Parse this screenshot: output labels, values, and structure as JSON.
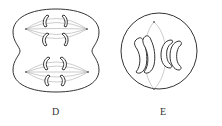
{
  "figure": {
    "panels": [
      {
        "id": "D",
        "label": "D",
        "description": "Cell undergoing second meiotic division with two spindles and cleavage furrow",
        "structures": [
          "cell-membrane-with-cleavage-furrow",
          "upper-spindle",
          "lower-spindle",
          "chromosomes",
          "centrioles"
        ]
      },
      {
        "id": "E",
        "label": "E",
        "description": "Round cell with single spindle and paired chromosomes",
        "structures": [
          "cell-membrane",
          "spindle",
          "chromosomes",
          "centrioles"
        ]
      }
    ],
    "colors": {
      "outline": "#333333",
      "spindle": "#999999",
      "background": "#ffffff"
    }
  }
}
